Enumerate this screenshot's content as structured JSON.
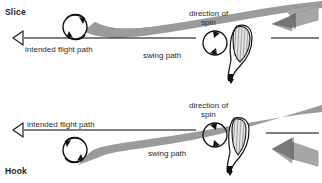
{
  "figure": {
    "background_color": "#ffffff",
    "band_color": "#9b9b9b",
    "arrow_color": "#a6a6a6",
    "ink_color": "#111111"
  },
  "panels": [
    {
      "id": "slice",
      "title": "Slice",
      "labels": {
        "intended_flight_path": "intended flight path",
        "swing_path": "swing path",
        "direction_of_spin_line1": "direction of",
        "direction_of_spin_line2": "spin"
      },
      "icons": {
        "ball": "golf-ball",
        "spin": "clockwise-spin-circle",
        "club": "club-head-open-face",
        "swing_arrow": "out-to-in-swing-arrow",
        "flight_arrow": "hollow-left-arrow"
      }
    },
    {
      "id": "hook",
      "title": "Hook",
      "labels": {
        "intended_flight_path": "intended flight path",
        "swing_path": "swing path",
        "direction_of_spin_line1": "direction of",
        "direction_of_spin_line2": "spin"
      },
      "icons": {
        "ball": "golf-ball",
        "spin": "counterclockwise-spin-circle",
        "club": "club-head-closed-face",
        "swing_arrow": "in-to-out-swing-arrow",
        "flight_arrow": "hollow-left-arrow"
      }
    }
  ]
}
